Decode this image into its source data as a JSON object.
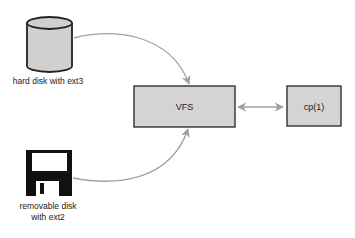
{
  "diagram": {
    "nodes": {
      "hard_disk": {
        "label": "hard disk with ext3",
        "icon": "cylinder-disk-icon"
      },
      "removable_disk": {
        "label_line1": "removable disk",
        "label_line2": "with ext2",
        "icon": "floppy-disk-icon"
      },
      "vfs": {
        "label": "VFS"
      },
      "cp": {
        "label": "cp(1)"
      }
    },
    "edges": [
      {
        "from": "hard disk with ext3",
        "to": "VFS",
        "type": "arrow"
      },
      {
        "from": "removable disk with ext2",
        "to": "VFS",
        "type": "arrow"
      },
      {
        "from": "VFS",
        "to": "cp(1)",
        "type": "bidirectional-arrow"
      }
    ],
    "colors": {
      "box_fill": "#d4d4d4",
      "box_stroke": "#333333",
      "arrow": "#a0a0a0",
      "disk_fill": "#d0d0d0",
      "floppy": "#111111"
    }
  }
}
